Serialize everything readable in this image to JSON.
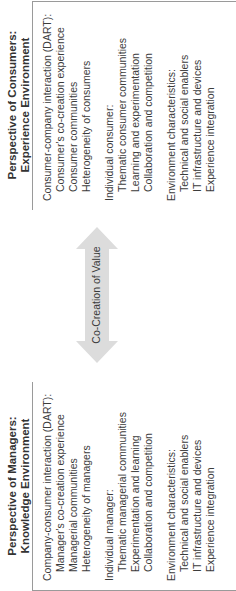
{
  "diagram": {
    "managers": {
      "title_line1": "Perspective of Managers:",
      "title_line2": "Knowledge Environment",
      "sections": [
        {
          "heading": "Company-consumer interaction (DART):",
          "items": [
            "Manager's co-creation experience",
            "Managerial communities",
            "Heterogeneity of managers"
          ]
        },
        {
          "heading": "Individual manager:",
          "items": [
            "Thematic managerial communities",
            "Experimentation and learning",
            "Collaboration and competition"
          ]
        },
        {
          "heading": "Environment characteristics:",
          "items": [
            "Technical and social enablers",
            "IT infrastructure and devices",
            "Experience integration"
          ]
        }
      ]
    },
    "consumers": {
      "title_line1": "Perspective of Consumers:",
      "title_line2": "Experience Environment",
      "sections": [
        {
          "heading": "Consumer-company interaction (DART):",
          "items": [
            "Consumer's co-creation experience",
            "Consumer communities",
            "Heterogeneity of consumers"
          ]
        },
        {
          "heading": "Individual consumer:",
          "items": [
            "Thematic consumer communities",
            "Learning and experimentation",
            "Collaboration and competition"
          ]
        },
        {
          "heading": "Environment characteristics:",
          "items": [
            "Technical and social enablers",
            "IT infrastructure and devices",
            "Experience integration"
          ]
        }
      ]
    },
    "arrow": {
      "label": "Co-Creation of Value",
      "fill_color": "#dcdcdc",
      "direction": "bidirectional"
    },
    "colors": {
      "border": "#9a9a9a",
      "text": "#3a3a3a"
    }
  }
}
